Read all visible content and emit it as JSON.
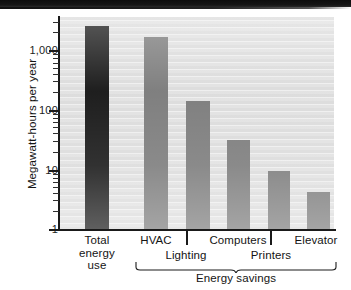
{
  "figure": {
    "y_axis_title": "Megawatt-hours per year",
    "group_bracket_label": "Energy savings"
  },
  "chart_data": {
    "type": "bar",
    "title": "",
    "xlabel": "",
    "ylabel": "Megawatt-hours per year",
    "scale": "log",
    "ylim": [
      1,
      4000
    ],
    "yticks": [
      1,
      10,
      100,
      1000
    ],
    "ytick_labels": [
      "1",
      "10",
      "100",
      "1,000"
    ],
    "grid": false,
    "legend": "none",
    "categories": [
      "Total energy use",
      "HVAC",
      "Lighting",
      "Computers",
      "Printers",
      "Elevator"
    ],
    "values": [
      2800,
      1800,
      150,
      33,
      9.5,
      4.2
    ],
    "colors": [
      "#1a1a1a",
      "#7d7d7d",
      "#7d7d7d",
      "#7d7d7d",
      "#7d7d7d",
      "#7d7d7d"
    ],
    "group_bracket": {
      "label": "Energy savings",
      "covers": [
        "HVAC",
        "Lighting",
        "Computers",
        "Printers",
        "Elevator"
      ]
    },
    "annotations": []
  },
  "y_ticks": [
    {
      "label": "1,000",
      "value": 1000
    },
    {
      "label": "100",
      "value": 100
    },
    {
      "label": "10",
      "value": 10
    },
    {
      "label": "1",
      "value": 1
    }
  ],
  "x_labels": {
    "total": "Total energy use",
    "total_line1": "Total",
    "total_line2": "energy",
    "total_line3": "use",
    "hvac": "HVAC",
    "lighting": "Lighting",
    "computers": "Computers",
    "printers": "Printers",
    "elevator": "Elevator"
  },
  "colors": {
    "bar_dark": "#1a1a1a",
    "bar_gray": "#7d7d7d",
    "plot_background": "#dcdcdc",
    "axis": "#1a1a1a",
    "text": "#141414"
  }
}
